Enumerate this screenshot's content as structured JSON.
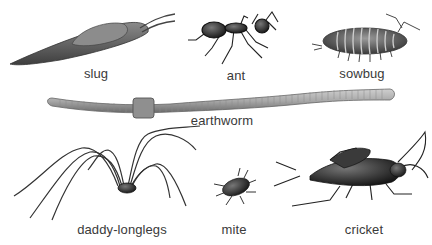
{
  "organisms": [
    {
      "id": "slug",
      "label": "slug",
      "x": 96,
      "y": 66
    },
    {
      "id": "ant",
      "label": "ant",
      "x": 236,
      "y": 68
    },
    {
      "id": "sowbug",
      "label": "sowbug",
      "x": 362,
      "y": 66
    },
    {
      "id": "earthworm",
      "label": "earthworm",
      "x": 222,
      "y": 113
    },
    {
      "id": "daddy-longlegs",
      "label": "daddy-longlegs",
      "x": 122,
      "y": 222
    },
    {
      "id": "mite",
      "label": "mite",
      "x": 234,
      "y": 222
    },
    {
      "id": "cricket",
      "label": "cricket",
      "x": 364,
      "y": 222
    }
  ],
  "colors": {
    "label_text": "#3a3a3a",
    "background": "#ffffff",
    "body_dark": "#2a2a2a",
    "body_mid": "#7a7a7a",
    "body_light": "#b5b5b5"
  }
}
